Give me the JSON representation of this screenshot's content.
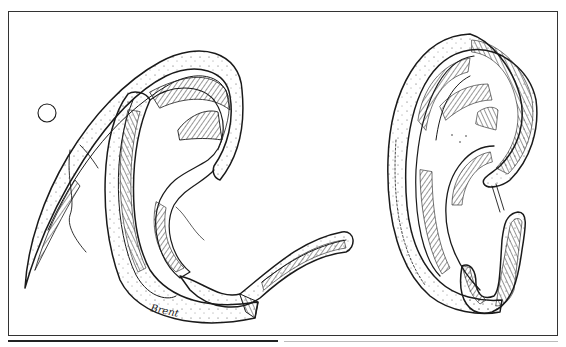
{
  "figure": {
    "signature": "Brent",
    "panels": [
      {
        "name": "left-framework",
        "description": "disassembled ear cartilage framework with suture"
      },
      {
        "name": "right-framework",
        "description": "assembled ear cartilage framework"
      }
    ],
    "colors": {
      "ink": "#1a1a1a",
      "paper": "#ffffff",
      "border": "#333333"
    }
  }
}
